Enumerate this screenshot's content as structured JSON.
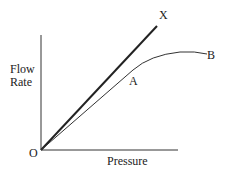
{
  "diagram": {
    "y_axis_label_line1": "Flow",
    "y_axis_label_line2": "Rate",
    "x_axis_label": "Pressure",
    "origin_label": "O",
    "line_label_x": "X",
    "curve_label_a": "A",
    "curve_label_b": "B",
    "colors": {
      "ink": "#222222",
      "background": "#ffffff"
    }
  }
}
